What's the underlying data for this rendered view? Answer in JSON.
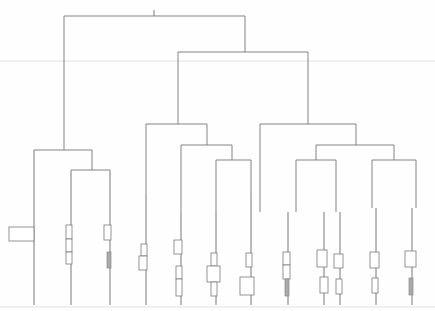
{
  "figure": {
    "title": "Hierarchical clustering dendrogram",
    "type": "dendrogram",
    "width": 435,
    "height": 311,
    "background_color": "#fefefe",
    "line_color": "#6f6f72",
    "glyph_open_fill": "#ffffff",
    "glyph_filled_fill": "#a9a9ad",
    "orientation": "top-down",
    "axis_visible": false,
    "labels_visible": false
  },
  "chart_data": {
    "type": "dendrogram",
    "title": "Hierarchical clustering dendrogram",
    "subtitle": "",
    "xlabel": "",
    "ylabel": "",
    "grid": false,
    "legend": null,
    "orientation": "top-down",
    "leaf_count": 13,
    "leaf_baseline_y": 305,
    "leaves": [
      {
        "id": "L1",
        "x": 34,
        "stem_top_y": 152,
        "glyphs": [
          {
            "shape": "rect-open",
            "x": 9,
            "y": 227,
            "w": 25,
            "h": 14
          }
        ]
      },
      {
        "id": "L2",
        "x": 71,
        "stem_top_y": 172,
        "glyphs": [
          {
            "shape": "rect-open",
            "x": 66,
            "y": 225,
            "w": 6,
            "h": 14
          },
          {
            "shape": "rect-open",
            "x": 66,
            "y": 239,
            "w": 6,
            "h": 13
          },
          {
            "shape": "rect-open",
            "x": 66,
            "y": 252,
            "w": 6,
            "h": 12
          }
        ]
      },
      {
        "id": "L3",
        "x": 110,
        "stem_top_y": 172,
        "glyphs": [
          {
            "shape": "rect-open",
            "x": 104,
            "y": 225,
            "w": 7,
            "h": 15
          },
          {
            "shape": "rect-filled",
            "x": 107,
            "y": 252,
            "w": 4,
            "h": 16
          }
        ]
      },
      {
        "id": "L4",
        "x": 146,
        "stem_top_y": 194,
        "glyphs": [
          {
            "shape": "rect-open",
            "x": 141,
            "y": 244,
            "w": 6,
            "h": 12
          },
          {
            "shape": "rect-open",
            "x": 139,
            "y": 256,
            "w": 8,
            "h": 14
          }
        ]
      },
      {
        "id": "L5",
        "x": 181,
        "stem_top_y": 212,
        "glyphs": [
          {
            "shape": "rect-open",
            "x": 174,
            "y": 240,
            "w": 8,
            "h": 14
          },
          {
            "shape": "rect-open",
            "x": 176,
            "y": 266,
            "w": 6,
            "h": 13
          },
          {
            "shape": "rect-open",
            "x": 176,
            "y": 279,
            "w": 6,
            "h": 17
          }
        ]
      },
      {
        "id": "L6",
        "x": 216,
        "stem_top_y": 212,
        "glyphs": [
          {
            "shape": "rect-open",
            "x": 211,
            "y": 253,
            "w": 6,
            "h": 13
          },
          {
            "shape": "rect-open",
            "x": 207,
            "y": 266,
            "w": 13,
            "h": 16
          },
          {
            "shape": "rect-open",
            "x": 211,
            "y": 282,
            "w": 6,
            "h": 14
          }
        ]
      },
      {
        "id": "L7",
        "x": 251,
        "stem_top_y": 193,
        "glyphs": [
          {
            "shape": "rect-open",
            "x": 246,
            "y": 253,
            "w": 6,
            "h": 14
          },
          {
            "shape": "rect-open",
            "x": 240,
            "y": 277,
            "w": 14,
            "h": 18
          }
        ]
      },
      {
        "id": "L8",
        "x": 288,
        "stem_top_y": 212,
        "glyphs": [
          {
            "shape": "rect-open",
            "x": 283,
            "y": 252,
            "w": 7,
            "h": 13
          },
          {
            "shape": "rect-open",
            "x": 283,
            "y": 265,
            "w": 7,
            "h": 14
          },
          {
            "shape": "rect-filled",
            "x": 285,
            "y": 279,
            "w": 4,
            "h": 17
          }
        ]
      },
      {
        "id": "L9",
        "x": 324,
        "stem_top_y": 212,
        "glyphs": [
          {
            "shape": "rect-open",
            "x": 317,
            "y": 250,
            "w": 10,
            "h": 17
          },
          {
            "shape": "rect-open",
            "x": 320,
            "y": 277,
            "w": 8,
            "h": 16
          }
        ]
      },
      {
        "id": "L10",
        "x": 340,
        "stem_top_y": 212,
        "glyphs": [
          {
            "shape": "rect-open",
            "x": 334,
            "y": 254,
            "w": 9,
            "h": 14
          },
          {
            "shape": "rect-open",
            "x": 336,
            "y": 279,
            "w": 6,
            "h": 15
          }
        ]
      },
      {
        "id": "L11",
        "x": 376,
        "stem_top_y": 208,
        "glyphs": [
          {
            "shape": "rect-open",
            "x": 370,
            "y": 252,
            "w": 9,
            "h": 16
          },
          {
            "shape": "rect-open",
            "x": 372,
            "y": 278,
            "w": 6,
            "h": 15
          }
        ]
      },
      {
        "id": "L12",
        "x": 412,
        "stem_top_y": 208,
        "glyphs": [
          {
            "shape": "rect-open",
            "x": 405,
            "y": 251,
            "w": 11,
            "h": 16
          },
          {
            "shape": "rect-filled",
            "x": 409,
            "y": 278,
            "w": 4,
            "h": 17
          }
        ]
      },
      {
        "id": "L13",
        "x": 290,
        "stem_top_y": 212,
        "glyphs": []
      }
    ],
    "merges": [
      {
        "id": "M-root",
        "y": 16,
        "x_left": 64,
        "x_right": 245,
        "children": [
          "M-left",
          "M-right"
        ],
        "height": 289,
        "label": "root"
      },
      {
        "id": "M-left",
        "y": 150,
        "x_left": 34,
        "x_right": 92,
        "children": [
          "L1",
          "M-left-b"
        ],
        "height": 155,
        "label": "left cluster"
      },
      {
        "id": "M-left-b",
        "y": 170,
        "x_left": 71,
        "x_right": 110,
        "children": [
          "L2",
          "L3"
        ],
        "height": 135,
        "label": "left inner pair"
      },
      {
        "id": "M-right",
        "y": 52,
        "x_left": 178,
        "x_right": 308,
        "children": [
          "M-mid",
          "M-far"
        ],
        "height": 253,
        "label": "right cluster"
      },
      {
        "id": "M-mid",
        "y": 124,
        "x_left": 146,
        "x_right": 207,
        "children": [
          "L4",
          "M-mid-b"
        ],
        "height": 181,
        "label": "middle cluster"
      },
      {
        "id": "M-mid-b",
        "y": 145,
        "x_left": 181,
        "x_right": 232,
        "children": [
          "L5",
          "M-mid-c"
        ],
        "height": 160,
        "label": "middle inner"
      },
      {
        "id": "M-mid-c",
        "y": 160,
        "x_left": 216,
        "x_right": 251,
        "children": [
          "L6",
          "L7"
        ],
        "height": 145,
        "label": "middle pair"
      },
      {
        "id": "M-far",
        "y": 124,
        "x_left": 260,
        "x_right": 356,
        "children": [
          "L8",
          "M-far-b"
        ],
        "height": 181,
        "label": "far right cluster"
      },
      {
        "id": "M-far-b",
        "y": 145,
        "x_left": 316,
        "x_right": 394,
        "children": [
          "M-far-c",
          "M-far-d"
        ],
        "height": 160,
        "label": "far right inner"
      },
      {
        "id": "M-far-c",
        "y": 160,
        "x_left": 296,
        "x_right": 336,
        "children": [
          "L9",
          "L10"
        ],
        "height": 145,
        "label": "far right pair A"
      },
      {
        "id": "M-far-d",
        "y": 160,
        "x_left": 372,
        "x_right": 416,
        "children": [
          "L11",
          "L12"
        ],
        "height": 145,
        "label": "far right pair B"
      }
    ],
    "root_tick": {
      "x": 154,
      "y_top": 10,
      "y_bottom": 16
    }
  }
}
